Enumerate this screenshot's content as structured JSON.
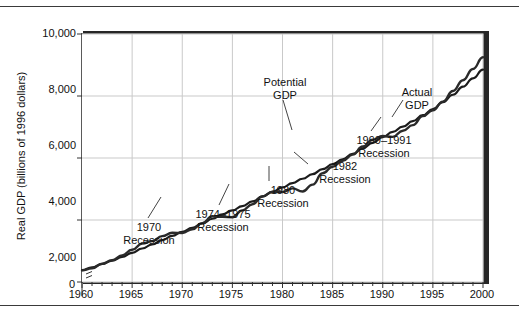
{
  "figure": {
    "y_axis_title": "Real GDP (billions of 1996 dollars)",
    "zero_label": "0"
  },
  "chart_data": {
    "type": "line",
    "title": "",
    "xlabel": "",
    "ylabel": "Real GDP (billions of 1996 dollars)",
    "xlim": [
      1960,
      2000
    ],
    "ylim": [
      2000,
      10000
    ],
    "y_axis_break": true,
    "grid": true,
    "legend": "inline-annotations",
    "x_ticks": [
      1960,
      1965,
      1970,
      1975,
      1980,
      1985,
      1990,
      1995,
      2000
    ],
    "x_tick_labels": [
      "1960",
      "1965",
      "1970",
      "1975",
      "1980",
      "1985",
      "1990",
      "1995",
      "2000"
    ],
    "x_minor_tick_step": 1,
    "y_ticks": [
      0,
      2000,
      4000,
      6000,
      8000,
      10000
    ],
    "y_tick_labels": [
      "0",
      "2,000",
      "4,000",
      "6,000",
      "8,000",
      "10,000"
    ],
    "x": [
      1960,
      1961,
      1962,
      1963,
      1964,
      1965,
      1966,
      1967,
      1968,
      1969,
      1970,
      1971,
      1972,
      1973,
      1974,
      1975,
      1976,
      1977,
      1978,
      1979,
      1980,
      1981,
      1982,
      1983,
      1984,
      1985,
      1986,
      1987,
      1988,
      1989,
      1990,
      1991,
      1992,
      1993,
      1994,
      1995,
      1996,
      1997,
      1998,
      1999,
      2000
    ],
    "series": [
      {
        "name": "Potential GDP",
        "color": "#1c1c1c",
        "style": "smooth",
        "values": [
          2380,
          2470,
          2580,
          2690,
          2810,
          2940,
          3080,
          3210,
          3350,
          3490,
          3620,
          3750,
          3890,
          4040,
          4180,
          4310,
          4450,
          4600,
          4760,
          4910,
          5050,
          5190,
          5330,
          5480,
          5640,
          5800,
          5960,
          6130,
          6310,
          6490,
          6670,
          6840,
          7010,
          7190,
          7380,
          7580,
          7800,
          8040,
          8300,
          8570,
          8850
        ]
      },
      {
        "name": "Actual GDP",
        "color": "#2a2a2a",
        "style": "wiggly",
        "values": [
          2380,
          2440,
          2590,
          2700,
          2860,
          3040,
          3240,
          3320,
          3480,
          3590,
          3580,
          3700,
          3900,
          4120,
          4100,
          4090,
          4310,
          4510,
          4760,
          4910,
          4900,
          5020,
          4920,
          5140,
          5510,
          5720,
          5910,
          6110,
          6370,
          6590,
          6710,
          6680,
          6880,
          7060,
          7350,
          7540,
          7820,
          8160,
          8510,
          8870,
          9250
        ]
      }
    ],
    "annotations": [
      {
        "id": "potential-gdp",
        "label": "Potential\nGDP",
        "label_lines": [
          "Potential",
          "GDP"
        ],
        "points_to_year": 1981
      },
      {
        "id": "actual-gdp",
        "label": "Actual\nGDP",
        "label_lines": [
          "Actual",
          "GDP"
        ],
        "points_to_year": 1993
      },
      {
        "id": "recession-1970",
        "label": "1970\nRecession",
        "label_lines": [
          "1970",
          "Recession"
        ],
        "points_to_year": 1970
      },
      {
        "id": "recession-1974-1975",
        "label": "1974–1975\nRecession",
        "label_lines": [
          "1974–1975",
          "Recession"
        ],
        "points_to_year": 1975
      },
      {
        "id": "recession-1980",
        "label": "1980\nRecession",
        "label_lines": [
          "1980",
          "Recession"
        ],
        "points_to_year": 1980
      },
      {
        "id": "recession-1982",
        "label": "1982\nRecession",
        "label_lines": [
          "1982",
          "Recession"
        ],
        "points_to_year": 1982
      },
      {
        "id": "recession-1990-1991",
        "label": "1990–1991\nRecession",
        "label_lines": [
          "1990–1991",
          "Recession"
        ],
        "points_to_year": 1991
      }
    ]
  }
}
